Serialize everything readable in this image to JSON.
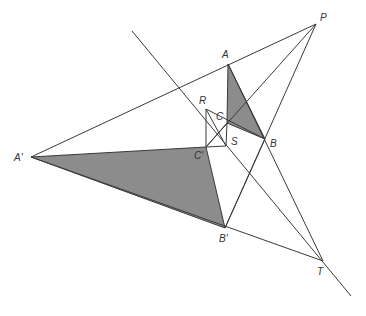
{
  "figure": {
    "colors": {
      "line": "#3a3a3a",
      "shade": "#8c8c8c",
      "label": "#333333",
      "background": "#ffffff"
    }
  },
  "points": {
    "P": {
      "label": "P",
      "x": 316,
      "y": 24
    },
    "A": {
      "label": "A",
      "x": 228,
      "y": 64
    },
    "B": {
      "label": "B",
      "x": 265,
      "y": 139
    },
    "C": {
      "label": "C",
      "x": 227,
      "y": 123
    },
    "A_prime": {
      "label": "A'",
      "x": 31,
      "y": 157
    },
    "B_prime": {
      "label": "B'",
      "x": 225,
      "y": 228
    },
    "C_prime": {
      "label": "C'",
      "x": 206,
      "y": 147
    },
    "R": {
      "label": "R",
      "x": 206,
      "y": 109
    },
    "S": {
      "label": "S",
      "x": 226,
      "y": 146
    },
    "T": {
      "label": "T",
      "x": 323,
      "y": 261
    }
  },
  "triangles": [
    {
      "name": "ABC",
      "vertices": [
        "A",
        "B",
        "C"
      ],
      "shaded": true
    },
    {
      "name": "A'B'C'",
      "vertices": [
        "A'",
        "B'",
        "C'"
      ],
      "shaded": true
    }
  ],
  "labels": {
    "P": "P",
    "A": "A",
    "B": "B",
    "C": "C",
    "A_prime": "A'",
    "B_prime": "B'",
    "C_prime": "C'",
    "R": "R",
    "S": "S",
    "T": "T"
  }
}
